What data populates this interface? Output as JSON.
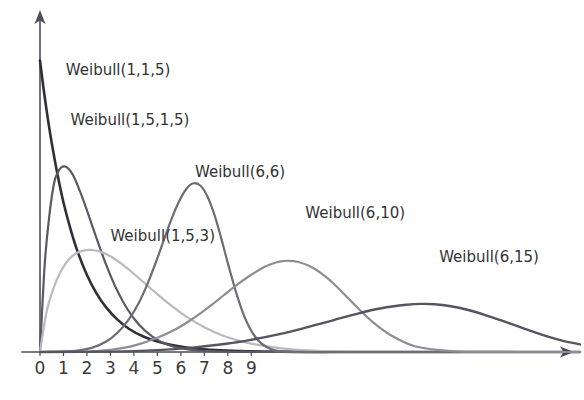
{
  "chart_data": {
    "type": "line",
    "title": "",
    "subtitle": "",
    "xlabel": "",
    "ylabel": "",
    "grid": false,
    "legend_position": "inline-annotations",
    "xlim": [
      0,
      23
    ],
    "ylim": [
      0,
      1.05
    ],
    "xticks": [
      "0",
      "1",
      "2",
      "3",
      "4",
      "5",
      "6",
      "7",
      "8",
      "9"
    ],
    "xtick_values": [
      0,
      1,
      2,
      3,
      4,
      5,
      6,
      7,
      8,
      9
    ],
    "yticks": [],
    "annotations": [
      {
        "text": "Weibull(1,1,5)",
        "x": 1.1,
        "y": 0.95,
        "color": "#3b3b42"
      },
      {
        "text": "Weibull(1,5,1,5)",
        "x": 1.3,
        "y": 0.78,
        "color": "#3b3b42"
      },
      {
        "text": "Weibull(6,6)",
        "x": 6.6,
        "y": 0.6,
        "color": "#3b3b42"
      },
      {
        "text": "Weibull(1,5,3)",
        "x": 3.0,
        "y": 0.38,
        "color": "#3b3b42"
      },
      {
        "text": "Weibull(6,10)",
        "x": 11.3,
        "y": 0.46,
        "color": "#3b3b42"
      },
      {
        "text": "Weibull(6,15)",
        "x": 17.0,
        "y": 0.31,
        "color": "#3b3b42"
      }
    ],
    "series": [
      {
        "name": "Weibull(1,1,5)",
        "label": "Weibull(1,1,5)",
        "shape": 1.0,
        "scale": 1.5,
        "color": "#2f2f38",
        "stroke_width": 2.6,
        "x": [
          0.0,
          0.15,
          0.3,
          0.5,
          0.75,
          1.0,
          1.3,
          1.6,
          2.0,
          2.4,
          2.8,
          3.3,
          3.8,
          4.4,
          5.0,
          5.8,
          6.6,
          7.5,
          8.5,
          9.5,
          11.0,
          13.0,
          15.0,
          18.0,
          21.0,
          23.0
        ],
        "y": [
          1.0,
          0.905,
          0.819,
          0.717,
          0.607,
          0.513,
          0.422,
          0.345,
          0.264,
          0.202,
          0.155,
          0.111,
          0.079,
          0.053,
          0.036,
          0.021,
          0.012,
          0.0067,
          0.0034,
          0.0018,
          0.00057,
          0.00012,
          3e-05,
          0.0,
          0.0,
          0.0
        ]
      },
      {
        "name": "Weibull(1,5,1,5)",
        "label": "Weibull(1,5,1,5)",
        "shape": 1.5,
        "scale": 1.5,
        "color": "#5a5a64",
        "stroke_width": 2.2,
        "x": [
          0.0,
          0.2,
          0.4,
          0.6,
          0.75,
          0.9,
          1.05,
          1.2,
          1.4,
          1.7,
          2.0,
          2.4,
          2.8,
          3.2,
          3.7,
          4.2,
          4.8,
          5.5,
          6.3,
          7.2,
          8.2,
          9.5,
          11.0,
          13.0,
          15.0,
          18.0,
          21.0,
          23.0
        ],
        "y": [
          0.0,
          0.3,
          0.47,
          0.58,
          0.615,
          0.633,
          0.637,
          0.63,
          0.608,
          0.552,
          0.486,
          0.392,
          0.303,
          0.226,
          0.15,
          0.095,
          0.052,
          0.023,
          0.0085,
          0.0027,
          0.0007,
          0.0001,
          0.0,
          0.0,
          0.0,
          0.0,
          0.0,
          0.0
        ]
      },
      {
        "name": "Weibull(1,5,3)",
        "label": "Weibull(1,5,3)",
        "shape": 1.5,
        "scale": 3.0,
        "color": "#b9b9c0",
        "stroke_width": 2.2,
        "x": [
          0.0,
          0.3,
          0.7,
          1.1,
          1.5,
          1.9,
          2.2,
          2.5,
          2.9,
          3.3,
          3.8,
          4.3,
          4.9,
          5.5,
          6.2,
          7.0,
          7.8,
          8.7,
          9.6,
          10.6,
          11.8,
          13.0,
          14.5,
          16.0,
          18.0,
          20.0,
          23.0
        ],
        "y": [
          0.0,
          0.145,
          0.245,
          0.305,
          0.337,
          0.349,
          0.35,
          0.346,
          0.333,
          0.313,
          0.282,
          0.247,
          0.205,
          0.165,
          0.123,
          0.085,
          0.056,
          0.034,
          0.02,
          0.01,
          0.0042,
          0.0016,
          0.0005,
          0.00012,
          2e-05,
          0.0,
          0.0
        ]
      },
      {
        "name": "Weibull(6,6)",
        "label": "Weibull(6,6)",
        "shape": 6.0,
        "scale": 6.0,
        "color": "#6d6d77",
        "stroke_width": 2.2,
        "x": [
          0.0,
          1.5,
          2.2,
          2.8,
          3.3,
          3.8,
          4.2,
          4.6,
          5.0,
          5.3,
          5.6,
          5.9,
          6.2,
          6.5,
          6.8,
          7.1,
          7.4,
          7.7,
          8.0,
          8.4,
          8.8,
          9.3,
          10.0,
          11.0,
          12.5,
          14.0,
          17.0,
          23.0
        ],
        "y": [
          0.0,
          0.004,
          0.014,
          0.035,
          0.066,
          0.114,
          0.167,
          0.238,
          0.322,
          0.39,
          0.456,
          0.513,
          0.556,
          0.578,
          0.573,
          0.539,
          0.478,
          0.396,
          0.305,
          0.192,
          0.104,
          0.039,
          0.0055,
          0.0002,
          0.0,
          0.0,
          0.0,
          0.0
        ]
      },
      {
        "name": "Weibull(6,10)",
        "label": "Weibull(6,10)",
        "shape": 6.0,
        "scale": 10.0,
        "color": "#8d8d96",
        "stroke_width": 2.2,
        "x": [
          0.0,
          2.0,
          3.0,
          4.0,
          5.0,
          5.8,
          6.5,
          7.2,
          7.8,
          8.4,
          8.9,
          9.4,
          9.8,
          10.2,
          10.6,
          11.0,
          11.5,
          12.0,
          12.5,
          13.0,
          13.6,
          14.2,
          15.0,
          16.0,
          17.5,
          19.0,
          21.0,
          23.0
        ],
        "y": [
          0.0,
          0.0015,
          0.0075,
          0.022,
          0.049,
          0.079,
          0.114,
          0.155,
          0.193,
          0.231,
          0.26,
          0.285,
          0.3,
          0.31,
          0.313,
          0.309,
          0.294,
          0.269,
          0.235,
          0.195,
          0.146,
          0.101,
          0.055,
          0.019,
          0.0031,
          0.0004,
          0.0,
          0.0
        ]
      },
      {
        "name": "Weibull(6,15)",
        "label": "Weibull(6,15)",
        "shape": 6.0,
        "scale": 15.0,
        "color": "#55555f",
        "stroke_width": 2.4,
        "x": [
          0.0,
          3.0,
          5.0,
          6.5,
          8.0,
          9.0,
          10.0,
          11.0,
          12.0,
          12.8,
          13.5,
          14.2,
          15.0,
          15.6,
          16.2,
          16.8,
          17.5,
          18.2,
          19.0,
          19.8,
          20.6,
          21.4,
          22.2,
          23.0
        ],
        "y": [
          0.0,
          0.0014,
          0.0065,
          0.015,
          0.029,
          0.042,
          0.058,
          0.077,
          0.098,
          0.116,
          0.131,
          0.145,
          0.156,
          0.162,
          0.165,
          0.164,
          0.157,
          0.145,
          0.126,
          0.104,
          0.081,
          0.059,
          0.04,
          0.026
        ]
      }
    ]
  },
  "axes": {
    "x_axis_name": "x-axis",
    "y_axis_name": "y-axis",
    "x_arrow": "arrow-right",
    "y_arrow": "arrow-up"
  },
  "style": {
    "background": "#ffffff",
    "axis_color": "#4d4d57",
    "tick_label_color": "#3a3a3a",
    "annotation_color": "#333333"
  }
}
